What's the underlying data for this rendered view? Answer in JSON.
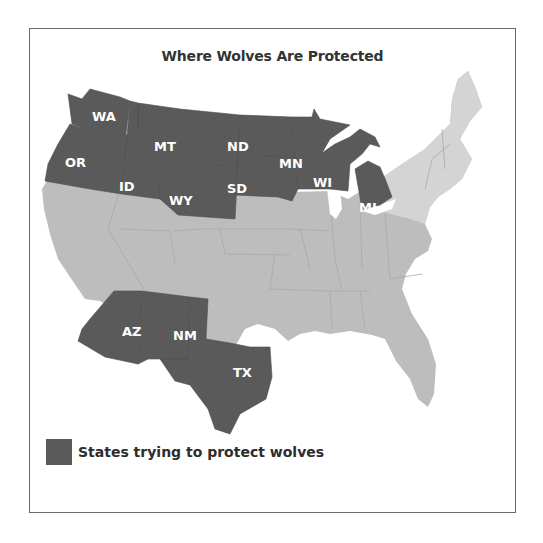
{
  "title": "Where Wolves Are Protected",
  "colors": {
    "protected": "#5a5a5a",
    "other_states": "#bdbdbd",
    "northeast_light": "#d6d6d6",
    "frame": "#6a6a6a",
    "label_text": "#ffffff"
  },
  "protected_states": [
    {
      "abbr": "WA",
      "label": "WA"
    },
    {
      "abbr": "OR",
      "label": "OR"
    },
    {
      "abbr": "ID",
      "label": "ID"
    },
    {
      "abbr": "MT",
      "label": "MT"
    },
    {
      "abbr": "WY",
      "label": "WY"
    },
    {
      "abbr": "ND",
      "label": "ND"
    },
    {
      "abbr": "SD",
      "label": "SD"
    },
    {
      "abbr": "MN",
      "label": "MN"
    },
    {
      "abbr": "WI",
      "label": "WI"
    },
    {
      "abbr": "MI",
      "label": "MI"
    },
    {
      "abbr": "AZ",
      "label": "AZ"
    },
    {
      "abbr": "NM",
      "label": "NM"
    },
    {
      "abbr": "TX",
      "label": "TX"
    }
  ],
  "legend": {
    "label": "States trying to protect wolves"
  }
}
